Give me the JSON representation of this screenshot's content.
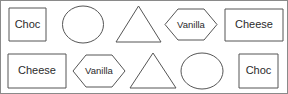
{
  "figure": {
    "width": 288,
    "height": 94,
    "background_color": "#ffffff",
    "frame_color": "#8a8a8a",
    "stroke_color": "#555555",
    "text_color": "#2b2b2b",
    "rows": 2,
    "columns": 5
  },
  "shapes": [
    {
      "id": "r1c1",
      "row": 1,
      "column": 1,
      "shape": "square",
      "label": "Choc",
      "labeled": true
    },
    {
      "id": "r1c2",
      "row": 1,
      "column": 2,
      "shape": "circle",
      "label": "",
      "labeled": false
    },
    {
      "id": "r1c3",
      "row": 1,
      "column": 3,
      "shape": "triangle",
      "label": "",
      "labeled": false
    },
    {
      "id": "r1c4",
      "row": 1,
      "column": 4,
      "shape": "hexagon",
      "label": "Vanilla",
      "labeled": true
    },
    {
      "id": "r1c5",
      "row": 1,
      "column": 5,
      "shape": "rectangle",
      "label": "Cheese",
      "labeled": true
    },
    {
      "id": "r2c1",
      "row": 2,
      "column": 1,
      "shape": "rectangle",
      "label": "Cheese",
      "labeled": true
    },
    {
      "id": "r2c2",
      "row": 2,
      "column": 2,
      "shape": "hexagon",
      "label": "Vanilla",
      "labeled": true
    },
    {
      "id": "r2c3",
      "row": 2,
      "column": 3,
      "shape": "triangle",
      "label": "",
      "labeled": false
    },
    {
      "id": "r2c4",
      "row": 2,
      "column": 4,
      "shape": "circle",
      "label": "",
      "labeled": false
    },
    {
      "id": "r2c5",
      "row": 2,
      "column": 5,
      "shape": "square",
      "label": "Choc",
      "labeled": true
    }
  ]
}
